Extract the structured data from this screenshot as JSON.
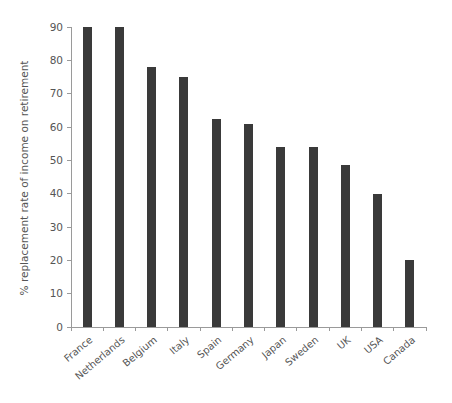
{
  "chart_data": {
    "type": "bar",
    "title": "",
    "subtitle": "",
    "xlabel": "",
    "ylabel": "% replacement rate of income on retirement",
    "categories": [
      "France",
      "Netherlands",
      "Belgium",
      "Italy",
      "Spain",
      "Germany",
      "Japan",
      "Sweden",
      "UK",
      "USA",
      "Canada"
    ],
    "values": [
      90,
      90,
      78,
      75,
      62.5,
      61,
      54,
      54,
      48.5,
      40,
      20
    ],
    "series": [
      {
        "name": "% replacement rate of income on retirement",
        "values": [
          90,
          90,
          78,
          75,
          62.5,
          61,
          54,
          54,
          48.5,
          40,
          20
        ]
      }
    ],
    "ylim": [
      0,
      90
    ],
    "yticks": [
      0,
      10,
      20,
      30,
      40,
      50,
      60,
      70,
      80,
      90
    ],
    "ytick_labels": [
      "0",
      "10",
      "20",
      "30",
      "40",
      "50",
      "60",
      "70",
      "80",
      "90"
    ],
    "grid": false,
    "legend": false,
    "legend_position": "none",
    "bar_color": "#3a3a3a",
    "axis_color": "#9a9a9a",
    "text_color": "#555555",
    "background_color": "#ffffff",
    "xtick_rotation_deg": 40
  },
  "axis": {
    "y_title": "% replacement rate of income on retirement"
  }
}
